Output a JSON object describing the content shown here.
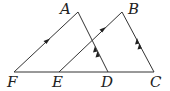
{
  "diagram": {
    "points": {
      "A": {
        "label": "A",
        "x": 78,
        "y": 12
      },
      "B": {
        "label": "B",
        "x": 122,
        "y": 12
      },
      "C": {
        "label": "C",
        "x": 154,
        "y": 72
      },
      "D": {
        "label": "D",
        "x": 108,
        "y": 72
      },
      "E": {
        "label": "E",
        "x": 59,
        "y": 72
      },
      "F": {
        "label": "F",
        "x": 14,
        "y": 72
      }
    },
    "segments": [
      "FC",
      "FA",
      "AD",
      "EB",
      "BC"
    ],
    "parallel_marks": {
      "single_arrow": [
        "FA",
        "EB"
      ],
      "double_arrow": [
        "AD",
        "BC"
      ]
    },
    "colors": {
      "line": "#333333",
      "text": "#222222"
    }
  }
}
